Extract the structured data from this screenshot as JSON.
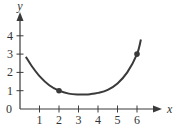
{
  "chart_data": {
    "type": "line",
    "title": "",
    "xlabel": "x",
    "ylabel": "y",
    "xlim": [
      0,
      6.7
    ],
    "ylim": [
      0,
      4.6
    ],
    "x_ticks": [
      1,
      2,
      3,
      4,
      5,
      6
    ],
    "y_ticks": [
      0,
      1,
      2,
      3,
      4
    ],
    "x_tick_labels": [
      "1",
      "2",
      "3",
      "4",
      "5",
      "6"
    ],
    "y_tick_labels": [
      "0",
      "1",
      "2",
      "3",
      "4"
    ],
    "grid": false,
    "legend": null,
    "series": [
      {
        "name": "curve",
        "x": [
          0.3,
          0.6,
          1.0,
          1.5,
          2.0,
          2.5,
          3.0,
          3.3,
          3.6,
          4.0,
          4.5,
          5.0,
          5.5,
          6.0,
          6.2
        ],
        "y": [
          2.85,
          2.35,
          1.8,
          1.3,
          1.0,
          0.84,
          0.79,
          0.79,
          0.81,
          0.88,
          1.05,
          1.4,
          2.0,
          3.0,
          3.8
        ]
      }
    ],
    "marked_points": [
      {
        "x": 2,
        "y": 1
      },
      {
        "x": 6,
        "y": 3
      }
    ],
    "color": "#3a3a3a"
  }
}
